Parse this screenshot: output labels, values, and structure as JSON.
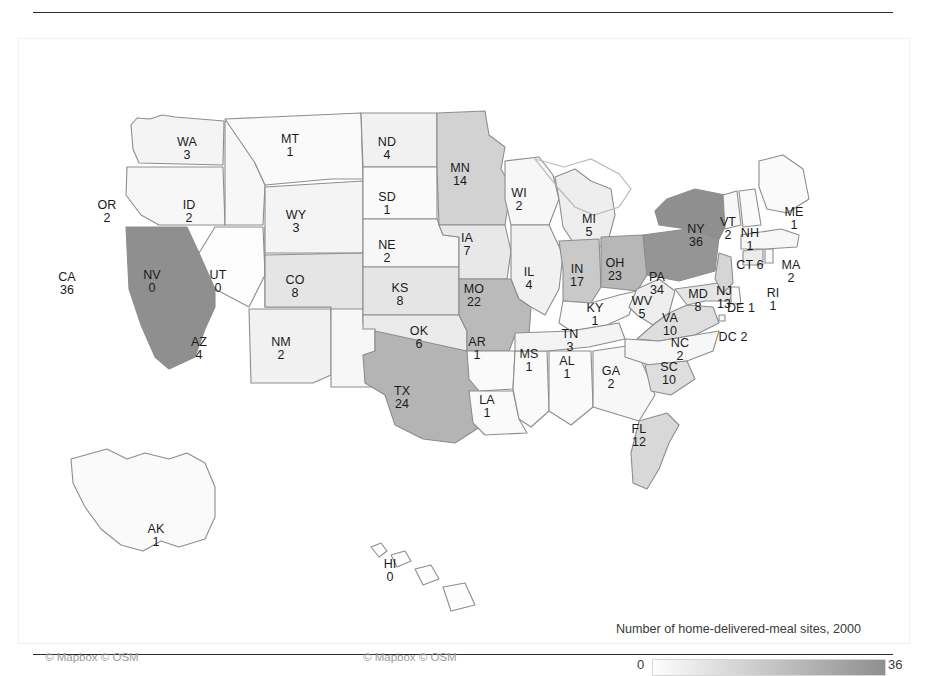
{
  "figure": {
    "kind": "choropleth-map",
    "region": "United States",
    "top_rule": true,
    "bottom_rule": true
  },
  "legend": {
    "title": "Number of home-delivered-meal sites, 2000",
    "min_label": "0",
    "max_label": "36",
    "min_value": 0,
    "max_value": 36,
    "ramp_low_color": "#fdfdfd",
    "ramp_high_color": "#8f8f8f"
  },
  "attribution": {
    "left": "© Mapbox © OSM",
    "right": "© Mapbox © OSM"
  },
  "chart_data": {
    "type": "map",
    "title": "Number of home-delivered-meal sites, 2000",
    "value_field": "home-delivered-meal sites",
    "year": 2000,
    "vmin": 0,
    "vmax": 36,
    "categories": [
      "AL",
      "AK",
      "AZ",
      "AR",
      "CA",
      "CO",
      "CT",
      "DE",
      "DC",
      "FL",
      "GA",
      "HI",
      "ID",
      "IL",
      "IN",
      "IA",
      "KS",
      "KY",
      "LA",
      "ME",
      "MD",
      "MA",
      "MI",
      "MN",
      "MS",
      "MO",
      "MT",
      "NE",
      "NV",
      "NH",
      "NJ",
      "NM",
      "NY",
      "NC",
      "ND",
      "OH",
      "OK",
      "OR",
      "PA",
      "RI",
      "SC",
      "SD",
      "TN",
      "TX",
      "UT",
      "VT",
      "VA",
      "WA",
      "WV",
      "WI",
      "WY"
    ],
    "values": [
      1,
      1,
      4,
      1,
      36,
      8,
      6,
      1,
      2,
      12,
      2,
      0,
      2,
      4,
      17,
      7,
      8,
      1,
      1,
      1,
      8,
      2,
      5,
      14,
      1,
      22,
      1,
      2,
      0,
      1,
      13,
      2,
      36,
      2,
      4,
      23,
      6,
      2,
      34,
      1,
      10,
      1,
      3,
      24,
      0,
      2,
      10,
      3,
      5,
      2,
      3
    ]
  },
  "states": [
    {
      "id": "WA",
      "label": "WA",
      "value": "3",
      "x": 168,
      "y": 105,
      "stack": true
    },
    {
      "id": "OR",
      "label": "OR",
      "value": "2",
      "x": 88,
      "y": 168,
      "stack": true
    },
    {
      "id": "CA",
      "label": "CA",
      "value": "36",
      "x": 48,
      "y": 240,
      "stack": true
    },
    {
      "id": "ID",
      "label": "ID",
      "value": "2",
      "x": 170,
      "y": 168,
      "stack": true
    },
    {
      "id": "NV",
      "label": "NV",
      "value": "0",
      "x": 133,
      "y": 238,
      "stack": true
    },
    {
      "id": "UT",
      "label": "UT",
      "value": "0",
      "x": 199,
      "y": 238,
      "stack": true
    },
    {
      "id": "AZ",
      "label": "AZ",
      "value": "4",
      "x": 180,
      "y": 305,
      "stack": true
    },
    {
      "id": "MT",
      "label": "MT",
      "value": "1",
      "x": 271,
      "y": 102,
      "stack": true
    },
    {
      "id": "WY",
      "label": "WY",
      "value": "3",
      "x": 277,
      "y": 178,
      "stack": true
    },
    {
      "id": "CO",
      "label": "CO",
      "value": "8",
      "x": 276,
      "y": 243,
      "stack": true
    },
    {
      "id": "NM",
      "label": "NM",
      "value": "2",
      "x": 262,
      "y": 305,
      "stack": true
    },
    {
      "id": "ND",
      "label": "ND",
      "value": "4",
      "x": 368,
      "y": 105,
      "stack": true
    },
    {
      "id": "SD",
      "label": "SD",
      "value": "1",
      "x": 368,
      "y": 160,
      "stack": true
    },
    {
      "id": "NE",
      "label": "NE",
      "value": "2",
      "x": 368,
      "y": 208,
      "stack": true
    },
    {
      "id": "KS",
      "label": "KS",
      "value": "8",
      "x": 381,
      "y": 251,
      "stack": true
    },
    {
      "id": "OK",
      "label": "OK",
      "value": "6",
      "x": 400,
      "y": 294,
      "stack": true
    },
    {
      "id": "TX",
      "label": "TX",
      "value": "24",
      "x": 383,
      "y": 354,
      "stack": true
    },
    {
      "id": "MN",
      "label": "MN",
      "value": "14",
      "x": 441,
      "y": 131,
      "stack": true
    },
    {
      "id": "IA",
      "label": "IA",
      "value": "7",
      "x": 448,
      "y": 201,
      "stack": true
    },
    {
      "id": "MO",
      "label": "MO",
      "value": "22",
      "x": 455,
      "y": 252,
      "stack": true
    },
    {
      "id": "AR",
      "label": "AR",
      "value": "1",
      "x": 458,
      "y": 305,
      "stack": true
    },
    {
      "id": "LA",
      "label": "LA",
      "value": "1",
      "x": 468,
      "y": 363,
      "stack": true
    },
    {
      "id": "WI",
      "label": "WI",
      "value": "2",
      "x": 500,
      "y": 156,
      "stack": true
    },
    {
      "id": "IL",
      "label": "IL",
      "value": "4",
      "x": 510,
      "y": 235,
      "stack": true
    },
    {
      "id": "MS",
      "label": "MS",
      "value": "1",
      "x": 510,
      "y": 317,
      "stack": true
    },
    {
      "id": "MI",
      "label": "MI",
      "value": "5",
      "x": 570,
      "y": 182,
      "stack": true
    },
    {
      "id": "IN",
      "label": "IN",
      "value": "17",
      "x": 558,
      "y": 232,
      "stack": true
    },
    {
      "id": "AL",
      "label": "AL",
      "value": "1",
      "x": 548,
      "y": 324,
      "stack": true
    },
    {
      "id": "OH",
      "label": "OH",
      "value": "23",
      "x": 596,
      "y": 226,
      "stack": true
    },
    {
      "id": "KY",
      "label": "KY",
      "value": "1",
      "x": 576,
      "y": 271,
      "stack": true
    },
    {
      "id": "TN",
      "label": "TN",
      "value": "3",
      "x": 551,
      "y": 297,
      "stack": true
    },
    {
      "id": "GA",
      "label": "GA",
      "value": "2",
      "x": 592,
      "y": 334,
      "stack": true
    },
    {
      "id": "FL",
      "label": "FL",
      "value": "12",
      "x": 620,
      "y": 392,
      "stack": true
    },
    {
      "id": "WV",
      "label": "WV",
      "value": "5",
      "x": 623,
      "y": 264,
      "stack": true
    },
    {
      "id": "VA",
      "label": "VA",
      "value": "10",
      "x": 651,
      "y": 281,
      "stack": true
    },
    {
      "id": "NC",
      "label": "NC",
      "value": "2",
      "x": 661,
      "y": 306,
      "stack": true
    },
    {
      "id": "SC",
      "label": "SC",
      "value": "10",
      "x": 650,
      "y": 330,
      "stack": true
    },
    {
      "id": "PA",
      "label": "PA",
      "value": "34",
      "x": 638,
      "y": 240,
      "stack": true
    },
    {
      "id": "NY",
      "label": "NY",
      "value": "36",
      "x": 677,
      "y": 192,
      "stack": true
    },
    {
      "id": "MD",
      "label": "MD",
      "value": "8",
      "x": 679,
      "y": 257,
      "stack": true
    },
    {
      "id": "DE",
      "label": "DE",
      "value": "1",
      "x": 722,
      "y": 271,
      "stack": false
    },
    {
      "id": "DC",
      "label": "DC",
      "value": "2",
      "x": 714,
      "y": 300,
      "stack": false
    },
    {
      "id": "NJ",
      "label": "NJ",
      "value": "13",
      "x": 705,
      "y": 254,
      "stack": true
    },
    {
      "id": "CT",
      "label": "CT",
      "value": "6",
      "x": 731,
      "y": 228,
      "stack": false
    },
    {
      "id": "RI",
      "label": "RI",
      "value": "1",
      "x": 754,
      "y": 256,
      "stack": true
    },
    {
      "id": "MA",
      "label": "MA",
      "value": "2",
      "x": 772,
      "y": 228,
      "stack": true
    },
    {
      "id": "VT",
      "label": "VT",
      "value": "2",
      "x": 709,
      "y": 185,
      "stack": true
    },
    {
      "id": "NH",
      "label": "NH",
      "value": "1",
      "x": 731,
      "y": 196,
      "stack": true
    },
    {
      "id": "ME",
      "label": "ME",
      "value": "1",
      "x": 775,
      "y": 175,
      "stack": true
    },
    {
      "id": "AK",
      "label": "AK",
      "value": "1",
      "x": 137,
      "y": 492,
      "stack": true
    },
    {
      "id": "HI",
      "label": "HI",
      "value": "0",
      "x": 371,
      "y": 527,
      "stack": true
    }
  ]
}
